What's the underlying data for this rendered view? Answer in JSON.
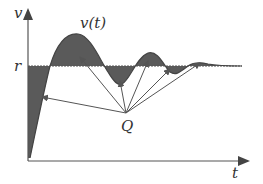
{
  "labels": {
    "y_axis": "v",
    "x_axis": "t",
    "curve": "v(t)",
    "reference": "r",
    "point": "Q"
  },
  "colors": {
    "fill": "#5a5a5a",
    "line": "#555555",
    "background": "#ffffff"
  },
  "geometry": {
    "origin": [
      28,
      161
    ],
    "reference_y": 66,
    "q_point": [
      126,
      113
    ],
    "arrow_targets": [
      [
        42,
        97
      ],
      [
        80,
        57
      ],
      [
        120,
        81
      ],
      [
        148,
        61
      ],
      [
        170,
        69
      ],
      [
        200,
        63
      ]
    ]
  }
}
